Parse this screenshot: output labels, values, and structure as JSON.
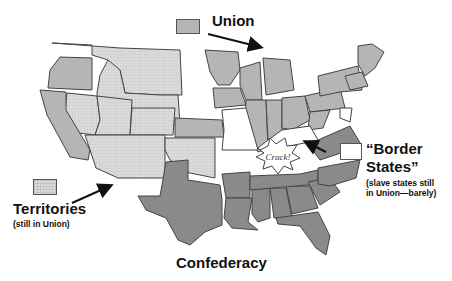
{
  "legend": {
    "union": {
      "label": "Union",
      "color": "#b5b5b5"
    },
    "territories": {
      "label": "Territories",
      "note": "(still in Union)",
      "color": "#dcdcdc",
      "pattern": "grid"
    },
    "border_states": {
      "label_line1": "“Border",
      "label_line2": "States”",
      "note_line1": "(slave states still",
      "note_line2": "in Union—barely)",
      "color": "#ffffff"
    },
    "confederacy": {
      "label_first": "C",
      "label_rest": "onfederacy",
      "color": "#8a8a8a"
    }
  },
  "annotation": {
    "burst_text": "Crack!"
  },
  "colors": {
    "outline": "#444444",
    "union": "#b5b5b5",
    "territory": "#dcdcdc",
    "confederacy": "#8a8a8a",
    "border": "#ffffff"
  }
}
